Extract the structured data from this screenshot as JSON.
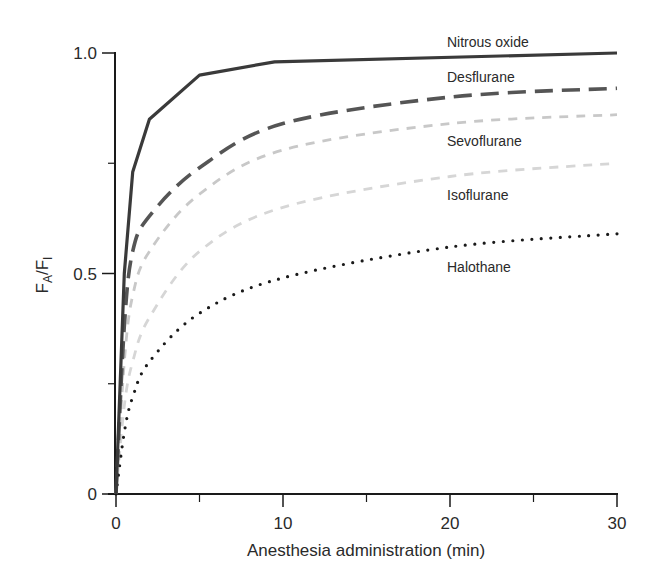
{
  "chart_data": {
    "type": "line",
    "title": "",
    "xlabel": "Anesthesia administration (min)",
    "ylabel_main": "F",
    "ylabel_sub_a": "A",
    "ylabel_slash": "/F",
    "ylabel_sub_i": "I",
    "ylabel": "FA/FI",
    "xlim": [
      0,
      30
    ],
    "ylim": [
      0,
      1.0
    ],
    "x_ticks": [
      0,
      10,
      20,
      30
    ],
    "x_tick_labels": [
      "0",
      "10",
      "20",
      "30"
    ],
    "x_minor_ticks": [
      5,
      15,
      25
    ],
    "y_ticks": [
      0,
      0.5,
      1.0
    ],
    "y_tick_labels": [
      "0",
      "0.5",
      "1.0"
    ],
    "y_minor_ticks": [
      0.25,
      0.75
    ],
    "grid": false,
    "legend": "inline labels at right",
    "series": [
      {
        "name": "Nitrous oxide",
        "style": "solid",
        "color": "#3a3a3a",
        "x": [
          0,
          0.5,
          1,
          2,
          5,
          9.5,
          30
        ],
        "values": [
          0,
          0.5,
          0.73,
          0.85,
          0.95,
          0.98,
          1.0
        ]
      },
      {
        "name": "Desflurane",
        "style": "dashed",
        "color": "#555555",
        "x": [
          0,
          0.5,
          1,
          2,
          5,
          10,
          20,
          30
        ],
        "values": [
          0,
          0.38,
          0.55,
          0.63,
          0.74,
          0.84,
          0.9,
          0.92
        ]
      },
      {
        "name": "Sevoflurane",
        "style": "dashed-light",
        "color": "#c8c8c8",
        "x": [
          0,
          0.5,
          1,
          2,
          5,
          10,
          20,
          30
        ],
        "values": [
          0,
          0.3,
          0.45,
          0.55,
          0.68,
          0.78,
          0.84,
          0.86
        ]
      },
      {
        "name": "Isoflurane",
        "style": "dashed-light",
        "color": "#d6d6d6",
        "x": [
          0,
          0.5,
          1,
          2,
          5,
          10,
          20,
          30
        ],
        "values": [
          0,
          0.2,
          0.3,
          0.4,
          0.55,
          0.65,
          0.72,
          0.75
        ]
      },
      {
        "name": "Halothane",
        "style": "dotted",
        "color": "#1a1a1a",
        "x": [
          0,
          0.5,
          1,
          2,
          5,
          10,
          20,
          30
        ],
        "values": [
          0,
          0.14,
          0.22,
          0.3,
          0.41,
          0.49,
          0.56,
          0.59
        ]
      }
    ],
    "series_labels": [
      {
        "text": "Nitrous oxide",
        "x_px": 447,
        "y_px": 47
      },
      {
        "text": "Desflurane",
        "x_px": 447,
        "y_px": 82
      },
      {
        "text": "Sevoflurane",
        "x_px": 447,
        "y_px": 146
      },
      {
        "text": "Isoflurane",
        "x_px": 447,
        "y_px": 200
      },
      {
        "text": "Halothane",
        "x_px": 447,
        "y_px": 272
      }
    ]
  }
}
